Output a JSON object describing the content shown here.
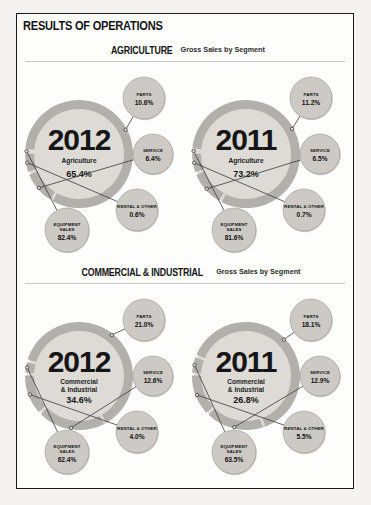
{
  "report": {
    "title": "RESULTS OF OPERATIONS"
  },
  "sections": [
    {
      "name": "AGRICULTURE",
      "subtitle": "Gross Sales by Segment",
      "charts": [
        {
          "year": "2012",
          "center_label": "Agriculture",
          "center_label_line2": "",
          "center_value": "65.4%",
          "segments": [
            {
              "name": "PARTS",
              "value": "10.6%"
            },
            {
              "name": "SERVICE",
              "value": "6.4%"
            },
            {
              "name": "RENTAL & OTHER",
              "value": "0.6%"
            },
            {
              "name": "EQUIPMENT SALES",
              "value": "82.4%"
            }
          ]
        },
        {
          "year": "2011",
          "center_label": "Agriculture",
          "center_label_line2": "",
          "center_value": "73.2%",
          "segments": [
            {
              "name": "PARTS",
              "value": "11.2%"
            },
            {
              "name": "SERVICE",
              "value": "6.5%"
            },
            {
              "name": "RENTAL & OTHER",
              "value": "0.7%"
            },
            {
              "name": "EQUIPMENT SALES",
              "value": "81.6%"
            }
          ]
        }
      ]
    },
    {
      "name": "COMMERCIAL & INDUSTRIAL",
      "subtitle": "Gross Sales by Segment",
      "charts": [
        {
          "year": "2012",
          "center_label": "Commercial",
          "center_label_line2": "& Industrial",
          "center_value": "34.6%",
          "segments": [
            {
              "name": "PARTS",
              "value": "21.0%"
            },
            {
              "name": "SERVICE",
              "value": "12.6%"
            },
            {
              "name": "RENTAL & OTHER",
              "value": "4.0%"
            },
            {
              "name": "EQUIPMENT SALES",
              "value": "62.4%"
            }
          ]
        },
        {
          "year": "2011",
          "center_label": "Commercial",
          "center_label_line2": "& Industrial",
          "center_value": "26.8%",
          "segments": [
            {
              "name": "PARTS",
              "value": "18.1%"
            },
            {
              "name": "SERVICE",
              "value": "12.9%"
            },
            {
              "name": "RENTAL & OTHER",
              "value": "5.5%"
            },
            {
              "name": "EQUIPMENT SALES",
              "value": "63.5%"
            }
          ]
        }
      ]
    }
  ],
  "colors": {
    "disc": "#dedbd7",
    "ring": "#b3b0ab",
    "bubble": "#cdcac5",
    "bubble_stroke": "#8d8a85",
    "text": "#141414",
    "page_bg": "#fdfdfc",
    "frame": "#1b1b1b"
  },
  "chart_data": {
    "type": "pie",
    "title": "RESULTS OF OPERATIONS",
    "note": "Donut charts of gross sales by segment; center value is that division's share of total gross sales, ring segments are share within the division.",
    "charts": [
      {
        "title": "AGRICULTURE Gross Sales by Segment",
        "year": 2012,
        "division_share_of_total": 65.4,
        "categories": [
          "EQUIPMENT SALES",
          "PARTS",
          "SERVICE",
          "RENTAL & OTHER"
        ],
        "values": [
          82.4,
          10.6,
          6.4,
          0.6
        ]
      },
      {
        "title": "AGRICULTURE Gross Sales by Segment",
        "year": 2011,
        "division_share_of_total": 73.2,
        "categories": [
          "EQUIPMENT SALES",
          "PARTS",
          "SERVICE",
          "RENTAL & OTHER"
        ],
        "values": [
          81.6,
          11.2,
          6.5,
          0.7
        ]
      },
      {
        "title": "COMMERCIAL & INDUSTRIAL Gross Sales by Segment",
        "year": 2012,
        "division_share_of_total": 34.6,
        "categories": [
          "EQUIPMENT SALES",
          "PARTS",
          "SERVICE",
          "RENTAL & OTHER"
        ],
        "values": [
          62.4,
          21.0,
          12.6,
          4.0
        ]
      },
      {
        "title": "COMMERCIAL & INDUSTRIAL Gross Sales by Segment",
        "year": 2011,
        "division_share_of_total": 26.8,
        "categories": [
          "EQUIPMENT SALES",
          "PARTS",
          "SERVICE",
          "RENTAL & OTHER"
        ],
        "values": [
          63.5,
          18.1,
          12.9,
          5.5
        ]
      }
    ]
  }
}
